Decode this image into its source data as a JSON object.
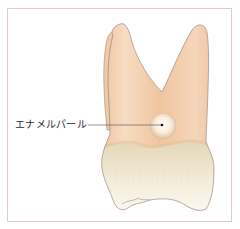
{
  "diagram": {
    "labels": [
      {
        "text": "エナメルパール",
        "target": "enamel-pearl"
      }
    ]
  },
  "colors": {
    "frame_border": "#e8c6cf",
    "root": "#f2cfae",
    "root_shadow": "#e7b68f",
    "crown_top": "#e9dcc0",
    "crown_bottom": "#fbf8ef",
    "outline": "#8a7b73",
    "pearl_center": "#fffaf3",
    "pearl_edge": "#e3c8a8",
    "leader_line": "#4a4a4a"
  }
}
